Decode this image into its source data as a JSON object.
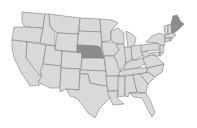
{
  "map": {
    "type": "us-states-choropleth",
    "background": "#ffffff",
    "colors": {
      "default_fill": "#d9d9d9",
      "highlight_fill": "#8c8c8c",
      "border": "#7d7d7d"
    },
    "highlighted_states": [
      "NE",
      "ME"
    ],
    "states": [
      {
        "id": "WA",
        "d": "M22,12 L45,14 L43,28 L25,27 L22,22 Z"
      },
      {
        "id": "OR",
        "d": "M14,27 L25,27 L43,28 L40,43 L12,40 L13,33 Z"
      },
      {
        "id": "CA",
        "d": "M12,40 L27,42 L26,58 L42,76 L40,85 L30,86 L21,72 L14,58 L12,48 Z"
      },
      {
        "id": "ID",
        "d": "M45,14 L49,14 L50,26 L55,33 L55,46 L40,43 L43,28 Z"
      },
      {
        "id": "NV",
        "d": "M27,42 L46,45 L42,70 L40,76 L26,58 Z"
      },
      {
        "id": "MT",
        "d": "M49,14 L80,18 L78,34 L57,33 L50,26 Z"
      },
      {
        "id": "WY",
        "d": "M57,33 L78,34 L77,52 L55,50 Z"
      },
      {
        "id": "UT",
        "d": "M46,45 L55,46 L55,50 L62,51 L61,66 L43,64 Z"
      },
      {
        "id": "AZ",
        "d": "M43,64 L61,66 L60,88 L50,88 L38,82 L42,76 L40,72 Z"
      },
      {
        "id": "CO",
        "d": "M62,51 L82,53 L81,69 L61,68 Z"
      },
      {
        "id": "NM",
        "d": "M61,68 L80,69 L79,90 L66,89 L60,92 L60,88 Z"
      },
      {
        "id": "ND",
        "d": "M80,18 L100,19 L101,32 L79,31 Z"
      },
      {
        "id": "SD",
        "d": "M79,31 L101,32 L102,47 L77,45 Z"
      },
      {
        "id": "NE",
        "d": "M77,45 L97,46 L101,48 L104,58 L82,58 L82,53 L77,52 Z"
      },
      {
        "id": "KS",
        "d": "M82,58 L104,58 L106,71 L81,70 Z"
      },
      {
        "id": "OK",
        "d": "M80,70 L106,71 L107,86 L98,85 L90,83 L88,74 L80,74 Z"
      },
      {
        "id": "TX",
        "d": "M80,74 L88,74 L90,83 L98,85 L107,86 L110,98 L100,108 L95,118 L88,113 L82,104 L76,98 L70,96 L66,89 L79,90 Z"
      },
      {
        "id": "MN",
        "d": "M100,19 L112,20 L118,23 L111,31 L111,40 L102,42 L101,32 Z"
      },
      {
        "id": "IA",
        "d": "M102,42 L116,42 L119,50 L114,56 L104,56 L102,47 Z"
      },
      {
        "id": "MO",
        "d": "M104,56 L114,56 L117,62 L121,70 L119,76 L106,76 L106,71 Z"
      },
      {
        "id": "AR",
        "d": "M106,76 L119,76 L118,90 L109,91 L107,86 Z"
      },
      {
        "id": "LA",
        "d": "M107,91 L118,91 L117,98 L124,104 L113,105 L110,98 Z"
      },
      {
        "id": "WI",
        "d": "M111,31 L118,28 L124,33 L124,44 L116,44 L111,40 Z"
      },
      {
        "id": "IL",
        "d": "M116,44 L124,44 L127,58 L124,68 L119,70 L117,62 L114,56 L119,50 Z"
      },
      {
        "id": "MI",
        "d": "M126,31 L132,34 L136,38 L134,47 L128,48 L127,40 Z"
      },
      {
        "id": "IN",
        "d": "M124,47 L131,47 L132,60 L126,63 Z"
      },
      {
        "id": "OH",
        "d": "M131,46 L141,45 L143,55 L136,60 L132,59 Z"
      },
      {
        "id": "KY",
        "d": "M124,67 L126,63 L132,60 L136,60 L143,58 L146,63 L138,68 L124,70 Z"
      },
      {
        "id": "TN",
        "d": "M119,72 L124,70 L138,68 L148,68 L146,73 L119,76 Z"
      },
      {
        "id": "MS",
        "d": "M118,77 L125,76 L125,96 L118,97 L118,90 Z"
      },
      {
        "id": "AL",
        "d": "M125,76 L133,75 L137,92 L129,93 L128,97 L125,96 Z"
      },
      {
        "id": "GA",
        "d": "M133,75 L140,74 L148,84 L146,93 L137,92 Z"
      },
      {
        "id": "FL",
        "d": "M129,93 L146,93 L150,100 L155,112 L152,117 L147,108 L142,98 L134,97 Z"
      },
      {
        "id": "SC",
        "d": "M140,74 L148,72 L155,77 L148,84 Z"
      },
      {
        "id": "NC",
        "d": "M146,73 L148,68 L164,64 L162,72 L155,77 L148,72 Z"
      },
      {
        "id": "VA",
        "d": "M143,58 L150,55 L156,56 L162,62 L164,64 L146,68 Z"
      },
      {
        "id": "WV",
        "d": "M141,52 L147,51 L150,55 L143,58 L143,55 Z"
      },
      {
        "id": "PA",
        "d": "M141,45 L158,43 L160,50 L147,51 L141,52 Z"
      },
      {
        "id": "NY",
        "d": "M146,42 L152,36 L160,33 L164,35 L165,45 L160,45 L158,43 Z"
      },
      {
        "id": "NJ",
        "d": "M160,45 L164,46 L163,54 L160,52 Z"
      },
      {
        "id": "MD",
        "d": "M150,53 L159,52 L160,56 L156,56 Z"
      },
      {
        "id": "DE",
        "d": "M159,52 L161,52 L161,56 L160,56 Z"
      },
      {
        "id": "VT",
        "d": "M164,26 L168,25 L168,34 L165,35 Z"
      },
      {
        "id": "NH",
        "d": "M168,25 L171,24 L172,33 L168,34 Z"
      },
      {
        "id": "MA",
        "d": "M165,35 L172,33 L176,35 L172,38 L165,38 Z"
      },
      {
        "id": "CT",
        "d": "M165,38 L170,38 L170,41 L165,42 Z"
      },
      {
        "id": "RI",
        "d": "M170,38 L172,38 L172,40 L170,41 Z"
      },
      {
        "id": "ME",
        "d": "M171,24 L173,16 L177,15 L181,22 L184,24 L178,30 L174,33 L172,33 Z"
      }
    ]
  }
}
